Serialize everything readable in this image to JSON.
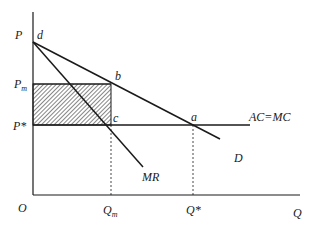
{
  "diagram": {
    "axes": {
      "y_label": "P",
      "x_label": "Q",
      "origin_label": "O"
    },
    "price_labels": {
      "monopoly_main": "P",
      "monopoly_sub": "m",
      "competitive": "P*"
    },
    "quantity_labels": {
      "monopoly_main": "Q",
      "monopoly_sub": "m",
      "competitive": "Q*"
    },
    "points": {
      "d": "d",
      "b": "b",
      "c": "c",
      "a": "a"
    },
    "curves": {
      "cost": "AC=MC",
      "demand": "D",
      "marginal_revenue": "MR"
    },
    "colors": {
      "line": "#1a1a1a",
      "hatch": "#333333",
      "background": "#ffffff"
    }
  }
}
